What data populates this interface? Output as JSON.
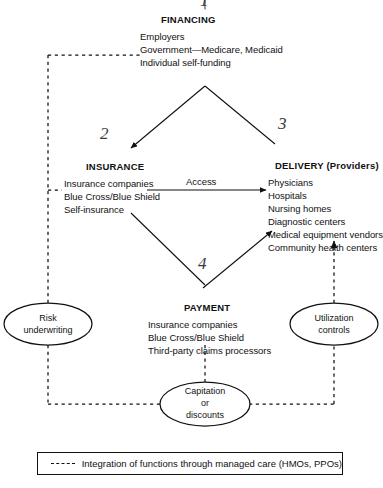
{
  "diagram": {
    "nodes": {
      "financing": {
        "number": "1",
        "header": "FINANCING",
        "items": [
          "Employers",
          "Government—Medicare, Medicaid",
          "Individual self-funding"
        ]
      },
      "insurance": {
        "number": "2",
        "header": "INSURANCE",
        "items": [
          "Insurance companies",
          "Blue Cross/Blue Shield",
          "Self-insurance"
        ]
      },
      "delivery": {
        "number": "3",
        "header": "DELIVERY (Providers)",
        "items": [
          "Physicians",
          "Hospitals",
          "Nursing homes",
          "Diagnostic centers",
          "Medical equipment vendors",
          "Community health centers"
        ]
      },
      "payment": {
        "number": "4",
        "header": "PAYMENT",
        "items": [
          "Insurance companies",
          "Blue Cross/Blue Shield",
          "Third-party claims processors"
        ]
      }
    },
    "ovals": {
      "risk": [
        "Risk",
        "underwriting"
      ],
      "utilization": [
        "Utilization",
        "controls"
      ],
      "capitation": [
        "Capitation",
        "or",
        "discounts"
      ]
    },
    "edge_labels": {
      "access": "Access"
    },
    "legend": {
      "text": "Integration of functions through managed care (HMOs, PPOs)",
      "swatch": "dashed-line-swatch"
    },
    "colors": {
      "ink": "#111111",
      "paper": "#ffffff",
      "pencil": "#3a3a3a"
    }
  }
}
